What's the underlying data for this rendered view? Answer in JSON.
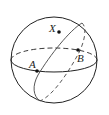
{
  "diagram": {
    "type": "sphere-great-circles",
    "points": [
      {
        "label": "X",
        "x": 59,
        "y": 32
      },
      {
        "label": "A",
        "x": 37,
        "y": 71
      },
      {
        "label": "B",
        "x": 78,
        "y": 50
      }
    ],
    "colors": {
      "stroke": "#222222",
      "background": "#ffffff"
    }
  }
}
